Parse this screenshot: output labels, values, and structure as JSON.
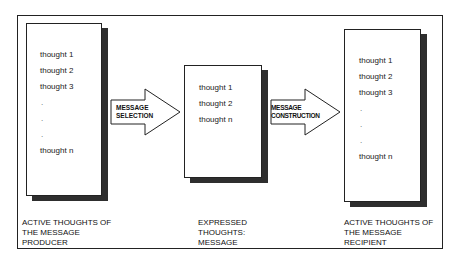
{
  "diagram": {
    "producer": {
      "items": [
        "thought 1",
        "thought 2",
        "thought 3",
        ".",
        ".",
        ".",
        "thought n"
      ],
      "caption": "ACTIVE THOUGHTS OF\nTHE MESSAGE\nPRODUCER"
    },
    "selection_arrow": {
      "label": "MESSAGE\nSELECTION"
    },
    "message": {
      "items": [
        "thought 1",
        "thought 2",
        "thought n"
      ],
      "caption": "EXPRESSED\nTHOUGHTS:\nMESSAGE"
    },
    "construction_arrow": {
      "label": "MESSAGE\nCONSTRUCTION"
    },
    "recipient": {
      "items": [
        "thought 1",
        "thought 2",
        "thought 3",
        ".",
        ".",
        ".",
        "thought n"
      ],
      "caption": "ACTIVE THOUGHTS OF\nTHE MESSAGE\nRECIPIENT"
    },
    "colors": {
      "line": "#222222",
      "shadow": "#2e2e2e",
      "background": "#ffffff"
    }
  }
}
